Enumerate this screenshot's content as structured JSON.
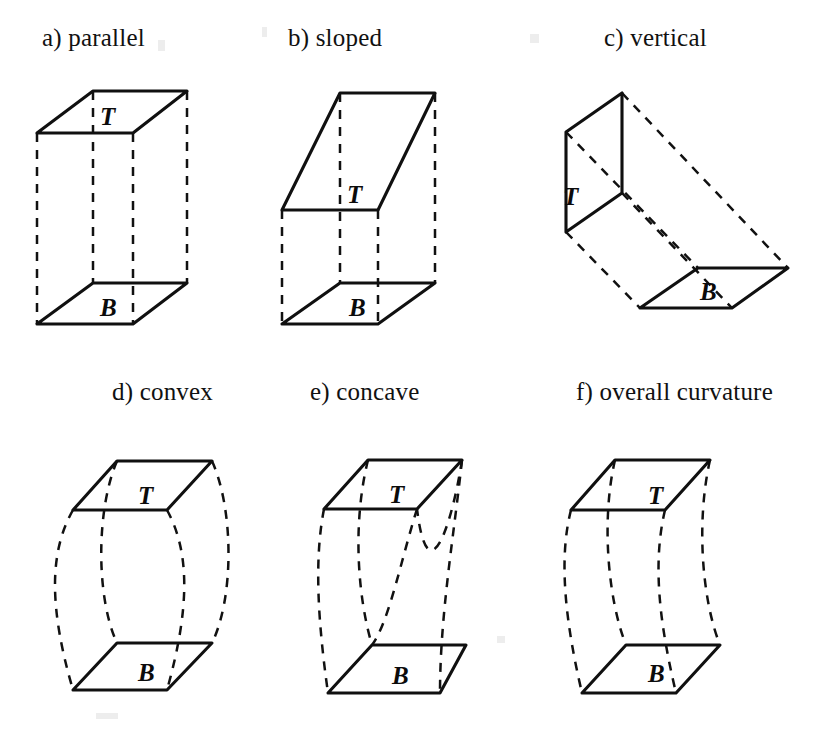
{
  "figure": {
    "background_color": "#ffffff",
    "ink_color": "#101010",
    "panels": [
      {
        "id": "a",
        "caption": "a) parallel",
        "caption_x": 42,
        "caption_y": 24,
        "top_label": "T",
        "top_label_x": 100,
        "top_label_y": 104,
        "bottom_label": "B",
        "bottom_label_x": 100,
        "bottom_label_y": 295,
        "description": "parallel top and bottom faces, vertical prism"
      },
      {
        "id": "b",
        "caption": "b) sloped",
        "caption_x": 288,
        "caption_y": 24,
        "top_label": "T",
        "top_label_x": 347,
        "top_label_y": 182,
        "bottom_label": "B",
        "bottom_label_x": 349,
        "bottom_label_y": 295,
        "description": "top face sloped relative to bottom face"
      },
      {
        "id": "c",
        "caption": "c) vertical",
        "caption_x": 604,
        "caption_y": 24,
        "top_label": "T",
        "top_label_x": 563,
        "top_label_y": 184,
        "bottom_label": "B",
        "bottom_label_x": 700,
        "bottom_label_y": 279,
        "description": "top face vertical, bottom face horizontal"
      },
      {
        "id": "d",
        "caption": "d) convex",
        "caption_x": 112,
        "caption_y": 378,
        "top_label": "T",
        "top_label_x": 138,
        "top_label_y": 483,
        "bottom_label": "B",
        "bottom_label_x": 138,
        "bottom_label_y": 660,
        "description": "barrel shaped, side edges bulge outward"
      },
      {
        "id": "e",
        "caption": "e) concave",
        "caption_x": 310,
        "caption_y": 378,
        "top_label": "T",
        "top_label_x": 389,
        "top_label_y": 482,
        "bottom_label": "B",
        "bottom_label_x": 392,
        "bottom_label_y": 663,
        "description": "hourglass shaped, side edges pinch inward"
      },
      {
        "id": "f",
        "caption": "f) overall curvature",
        "caption_x": 576,
        "caption_y": 378,
        "top_label": "T",
        "top_label_x": 648,
        "top_label_y": 483,
        "bottom_label": "B",
        "bottom_label_x": 648,
        "bottom_label_y": 661,
        "description": "side edges bend in an S curve, whole solid leans"
      }
    ]
  }
}
